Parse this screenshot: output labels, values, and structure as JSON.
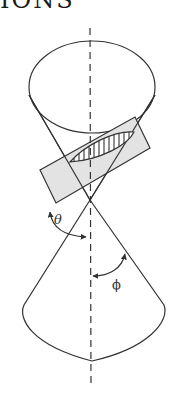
{
  "heading": {
    "text": "IONS"
  },
  "diagram": {
    "labels": {
      "theta": "θ",
      "phi": "ϕ"
    },
    "colors": {
      "stroke": "#333333",
      "plane_fill": "#e3e3e3",
      "background": "#ffffff"
    },
    "elements": [
      "upper-nappe",
      "lower-nappe",
      "cone-axis",
      "cutting-plane",
      "ellipse-section",
      "theta-angle-arc",
      "phi-angle-arc"
    ]
  }
}
